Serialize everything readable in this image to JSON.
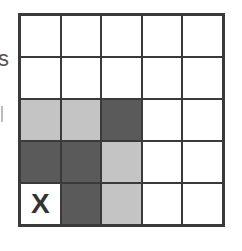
{
  "edge_text": "s",
  "grid": {
    "rows": 5,
    "cols": 5,
    "colors": {
      "white": "#ffffff",
      "light": "#c4c4c4",
      "dark": "#5a5a5a",
      "border": "#3a3a3a"
    },
    "cells": [
      [
        {
          "shade": "white",
          "label": ""
        },
        {
          "shade": "white",
          "label": ""
        },
        {
          "shade": "white",
          "label": ""
        },
        {
          "shade": "white",
          "label": ""
        },
        {
          "shade": "white",
          "label": ""
        }
      ],
      [
        {
          "shade": "white",
          "label": ""
        },
        {
          "shade": "white",
          "label": ""
        },
        {
          "shade": "white",
          "label": ""
        },
        {
          "shade": "white",
          "label": ""
        },
        {
          "shade": "white",
          "label": ""
        }
      ],
      [
        {
          "shade": "light",
          "label": ""
        },
        {
          "shade": "light",
          "label": ""
        },
        {
          "shade": "dark",
          "label": ""
        },
        {
          "shade": "white",
          "label": ""
        },
        {
          "shade": "white",
          "label": ""
        }
      ],
      [
        {
          "shade": "dark",
          "label": ""
        },
        {
          "shade": "dark",
          "label": ""
        },
        {
          "shade": "light",
          "label": ""
        },
        {
          "shade": "white",
          "label": ""
        },
        {
          "shade": "white",
          "label": ""
        }
      ],
      [
        {
          "shade": "white",
          "label": "X"
        },
        {
          "shade": "dark",
          "label": ""
        },
        {
          "shade": "light",
          "label": ""
        },
        {
          "shade": "white",
          "label": ""
        },
        {
          "shade": "white",
          "label": ""
        }
      ]
    ]
  }
}
